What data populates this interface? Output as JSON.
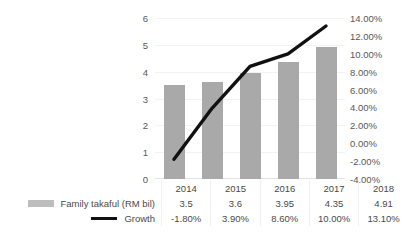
{
  "chart_data": {
    "type": "bar",
    "title": "",
    "xlabel": "",
    "ylabel": "",
    "categories": [
      "2014",
      "2015",
      "2016",
      "2017",
      "2018"
    ],
    "grid": true,
    "legend_position": "bottom-left",
    "axes": {
      "left": {
        "ticks": [
          "0",
          "1",
          "2",
          "3",
          "4",
          "5",
          "6"
        ],
        "values": [
          0,
          1,
          2,
          3,
          4,
          5,
          6
        ],
        "min": 0,
        "max": 6
      },
      "right": {
        "ticks": [
          "-4.00%",
          "-2.00%",
          "0.00%",
          "2.00%",
          "4.00%",
          "6.00%",
          "8.00%",
          "10.00%",
          "12.00%",
          "14.00%"
        ],
        "values": [
          -4,
          -2,
          0,
          2,
          4,
          6,
          8,
          10,
          12,
          14
        ],
        "min": -4,
        "max": 14
      }
    },
    "series": [
      {
        "name": "Family takaful (RM bil)",
        "type": "bar",
        "axis": "left",
        "color": "#a9a9a9",
        "values": [
          3.5,
          3.6,
          3.95,
          4.35,
          4.91
        ],
        "labels": [
          "3.5",
          "3.6",
          "3.95",
          "4.35",
          "4.91"
        ]
      },
      {
        "name": "Growth",
        "type": "line",
        "axis": "right",
        "color": "#111111",
        "values": [
          -1.8,
          3.9,
          8.6,
          10.0,
          13.1
        ],
        "labels": [
          "-1.80%",
          "3.90%",
          "8.60%",
          "10.00%",
          "13.10%"
        ]
      }
    ]
  },
  "legend": {
    "items": [
      {
        "label": "Family takaful (RM bil)",
        "marker": "bar-swatch",
        "color": "#bdbdbd"
      },
      {
        "label": "Growth",
        "marker": "line-swatch",
        "color": "#111111"
      }
    ]
  },
  "data_table": {
    "header": [
      "2014",
      "2015",
      "2016",
      "2017",
      "2018"
    ],
    "rows": [
      {
        "label": "Family takaful (RM bil)",
        "cells": [
          "3.5",
          "3.6",
          "3.95",
          "4.35",
          "4.91"
        ]
      },
      {
        "label": "Growth",
        "cells": [
          "-1.80%",
          "3.90%",
          "8.60%",
          "10.00%",
          "13.10%"
        ]
      }
    ]
  }
}
